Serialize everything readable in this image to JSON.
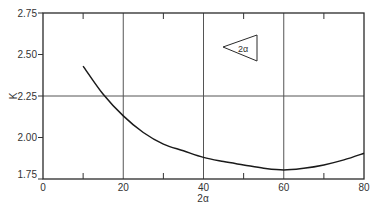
{
  "chart_data": {
    "type": "line",
    "title": "",
    "xlabel": "2α",
    "ylabel": "K",
    "xlim": [
      0,
      80
    ],
    "ylim": [
      1.75,
      2.75
    ],
    "grid": true,
    "x_ticks": [
      "0",
      "20",
      "40",
      "60",
      "80"
    ],
    "x_minor_ticks": [
      10,
      30,
      50,
      70
    ],
    "y_ticks": [
      "1.75",
      "2.00",
      "2.25",
      "2.50",
      "2.75"
    ],
    "gridlines": {
      "x": [
        20,
        40,
        60
      ],
      "y": [
        2.25
      ]
    },
    "series": [
      {
        "name": "K vs 2α",
        "x": [
          10,
          15,
          20,
          25,
          30,
          35,
          40,
          45,
          50,
          55,
          60,
          65,
          70,
          75,
          80
        ],
        "y": [
          2.43,
          2.26,
          2.13,
          2.03,
          1.96,
          1.92,
          1.88,
          1.855,
          1.835,
          1.815,
          1.805,
          1.815,
          1.835,
          1.865,
          1.905
        ]
      }
    ],
    "annotations": [
      {
        "type": "inset-triangle",
        "label": "2α",
        "position": {
          "x": 47,
          "y": 2.5
        }
      }
    ]
  },
  "inset": {
    "label": "2α"
  }
}
